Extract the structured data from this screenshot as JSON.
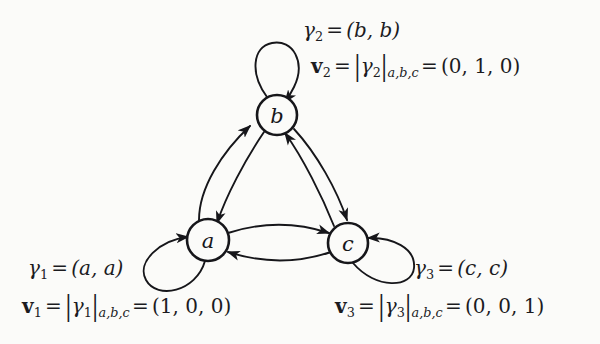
{
  "figure": {
    "name": "de-bruijn-style-state-transition-graph",
    "background_color": "#fbfbf9",
    "ink_color": "#16161a"
  },
  "graph": {
    "nodes": [
      {
        "id": "a",
        "label": "a",
        "cx": 208,
        "cy": 240,
        "r": 21
      },
      {
        "id": "b",
        "label": "b",
        "cx": 277,
        "cy": 115,
        "r": 20
      },
      {
        "id": "c",
        "label": "c",
        "cx": 348,
        "cy": 243,
        "r": 20
      }
    ],
    "edges": [
      {
        "from": "a",
        "to": "b",
        "kind": "curved-arrow"
      },
      {
        "from": "b",
        "to": "a",
        "kind": "curved-arrow"
      },
      {
        "from": "b",
        "to": "c",
        "kind": "curved-arrow"
      },
      {
        "from": "c",
        "to": "b",
        "kind": "curved-arrow"
      },
      {
        "from": "a",
        "to": "c",
        "kind": "curved-arrow"
      },
      {
        "from": "c",
        "to": "a",
        "kind": "curved-arrow"
      },
      {
        "from": "a",
        "to": "a",
        "kind": "self-loop",
        "direction": "down-left"
      },
      {
        "from": "b",
        "to": "b",
        "kind": "self-loop",
        "direction": "up"
      },
      {
        "from": "c",
        "to": "c",
        "kind": "self-loop",
        "direction": "down-right"
      }
    ]
  },
  "labels": {
    "gamma2": {
      "sym": "γ",
      "sub": "2",
      "eq": "=",
      "value": "(b, b)"
    },
    "v2": {
      "sym": "v",
      "sub": "2",
      "eq": "=",
      "abs_open": "|",
      "abs_sym": "γ",
      "abs_sub": "2",
      "abs_close": "|",
      "abs_basis": "a,b,c",
      "eq2": "=",
      "value": "(0, 1, 0)"
    },
    "gamma1": {
      "sym": "γ",
      "sub": "1",
      "eq": "=",
      "value": "(a, a)"
    },
    "v1": {
      "sym": "v",
      "sub": "1",
      "eq": "=",
      "abs_open": "|",
      "abs_sym": "γ",
      "abs_sub": "1",
      "abs_close": "|",
      "abs_basis": "a,b,c",
      "eq2": "=",
      "value": "(1, 0, 0)"
    },
    "gamma3": {
      "sym": "γ",
      "sub": "3",
      "eq": "=",
      "value": "(c, c)"
    },
    "v3": {
      "sym": "v",
      "sub": "3",
      "eq": "=",
      "abs_open": "|",
      "abs_sym": "γ",
      "abs_sub": "3",
      "abs_close": "|",
      "abs_basis": "a,b,c",
      "eq2": "=",
      "value": "(0, 0, 1)"
    }
  }
}
